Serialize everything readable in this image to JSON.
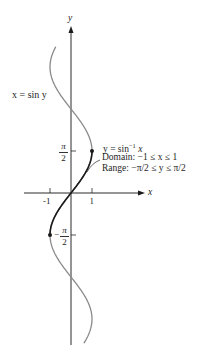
{
  "figure": {
    "axes": {
      "x_label": "x",
      "y_label": "y",
      "x_ticks": [
        "-1",
        "1"
      ],
      "y_ticks": [
        {
          "sign": "",
          "num": "π",
          "den": "2"
        },
        {
          "sign": "−",
          "num": "π",
          "den": "2"
        }
      ]
    },
    "curve_labels": {
      "sin_curve": "x = sin y",
      "inverse_curve": {
        "equation_prefix": "y = sin",
        "equation_sup": "−1",
        "equation_suffix": " x",
        "domain": "Domain: −1 ≤ x ≤ 1",
        "range": "Range: −π/2 ≤ y ≤ π/2"
      }
    },
    "colors": {
      "axis": "#2a2a2a",
      "full_curve": "#8a8a8a",
      "restricted_curve": "#1a1a1a",
      "text": "#1e1e1e"
    }
  }
}
